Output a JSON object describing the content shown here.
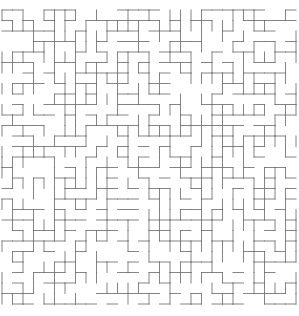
{
  "page": {
    "background_color": "#ffffff",
    "width": 299,
    "height": 316
  },
  "maze": {
    "rows": 28,
    "cols": 28,
    "cell": 10.5,
    "origin_x": 2,
    "origin_y": 10,
    "wall_color": "#6e6e6e",
    "wall_opacity": 0.85,
    "wall_width": 1,
    "h_density": 0.53,
    "v_density": 0.53,
    "seed": 1337
  }
}
